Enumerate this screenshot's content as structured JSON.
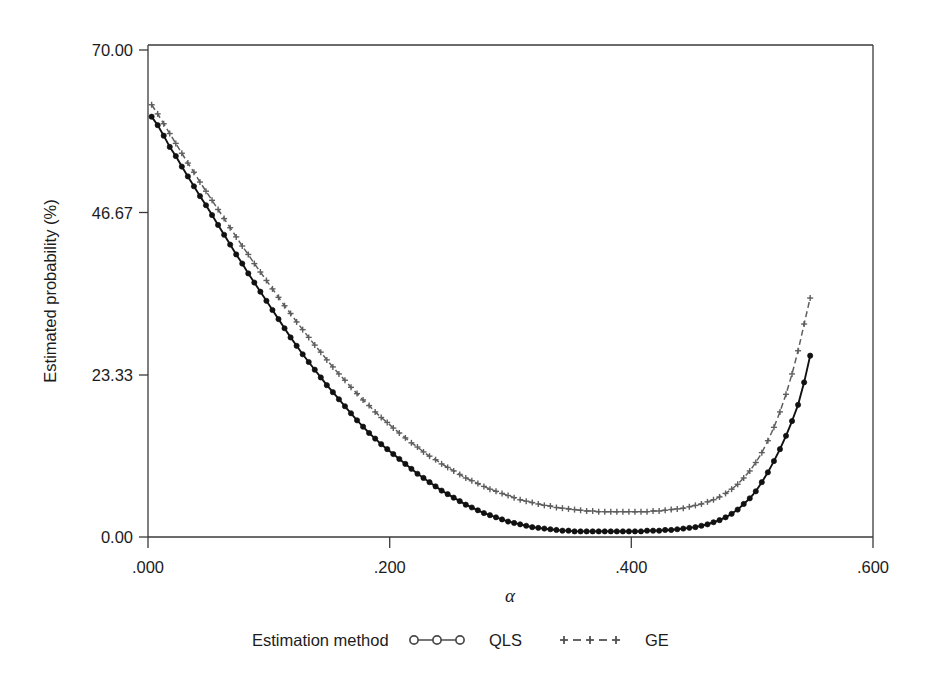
{
  "figure": {
    "background_color": "#ffffff",
    "frame_color": "#3a3a3a"
  },
  "chart_data": {
    "type": "line",
    "title": "",
    "subtitle": "",
    "xlabel": "α",
    "ylabel": "Estimated probability (%)",
    "xlim": [
      0.0,
      0.6
    ],
    "ylim": [
      0.0,
      70.0
    ],
    "grid": false,
    "legend_position": "bottom",
    "legend_title": "Estimation method",
    "x_ticks": [
      0.0,
      0.2,
      0.4,
      0.6
    ],
    "x_tick_labels": [
      ".000",
      ".200",
      ".400",
      ".600"
    ],
    "y_ticks": [
      0.0,
      23.33,
      46.67,
      70.0
    ],
    "y_tick_labels": [
      "0.00",
      "23.33",
      "46.67",
      "70.00"
    ],
    "x": [
      0.003,
      0.008,
      0.013,
      0.018,
      0.023,
      0.028,
      0.033,
      0.038,
      0.043,
      0.048,
      0.053,
      0.058,
      0.063,
      0.068,
      0.073,
      0.078,
      0.083,
      0.088,
      0.093,
      0.098,
      0.103,
      0.108,
      0.113,
      0.118,
      0.123,
      0.128,
      0.133,
      0.138,
      0.143,
      0.148,
      0.153,
      0.158,
      0.163,
      0.168,
      0.173,
      0.178,
      0.183,
      0.188,
      0.193,
      0.198,
      0.203,
      0.208,
      0.213,
      0.218,
      0.223,
      0.228,
      0.233,
      0.238,
      0.243,
      0.248,
      0.253,
      0.258,
      0.263,
      0.268,
      0.273,
      0.278,
      0.283,
      0.288,
      0.293,
      0.298,
      0.303,
      0.308,
      0.313,
      0.318,
      0.323,
      0.328,
      0.333,
      0.338,
      0.343,
      0.348,
      0.353,
      0.358,
      0.363,
      0.368,
      0.373,
      0.378,
      0.383,
      0.388,
      0.393,
      0.398,
      0.403,
      0.408,
      0.413,
      0.418,
      0.423,
      0.428,
      0.433,
      0.438,
      0.443,
      0.448,
      0.453,
      0.458,
      0.463,
      0.468,
      0.473,
      0.478,
      0.483,
      0.488,
      0.493,
      0.498,
      0.503,
      0.508,
      0.513,
      0.518,
      0.523,
      0.528,
      0.533,
      0.538,
      0.543,
      0.548
    ],
    "series": [
      {
        "name": "QLS",
        "marker": "circle-filled",
        "linestyle": "solid",
        "color": "#111111",
        "values": [
          59.8,
          58.6,
          57.1,
          55.5,
          54.2,
          52.7,
          51.3,
          49.9,
          48.5,
          47.2,
          45.8,
          44.4,
          43.0,
          41.6,
          40.2,
          38.9,
          37.5,
          36.2,
          34.9,
          33.6,
          32.3,
          31.0,
          29.7,
          28.4,
          27.2,
          26.0,
          24.9,
          23.8,
          22.7,
          21.6,
          20.6,
          19.6,
          18.6,
          17.6,
          16.6,
          15.7,
          14.8,
          14.0,
          13.2,
          12.5,
          11.8,
          11.1,
          10.4,
          9.7,
          9.0,
          8.4,
          7.8,
          7.2,
          6.6,
          6.1,
          5.6,
          5.1,
          4.6,
          4.2,
          3.8,
          3.4,
          3.1,
          2.8,
          2.5,
          2.2,
          2.0,
          1.8,
          1.6,
          1.4,
          1.3,
          1.2,
          1.1,
          1.0,
          0.9,
          0.9,
          0.8,
          0.8,
          0.8,
          0.8,
          0.8,
          0.8,
          0.8,
          0.8,
          0.8,
          0.8,
          0.8,
          0.8,
          0.9,
          0.9,
          0.9,
          1.0,
          1.0,
          1.1,
          1.2,
          1.3,
          1.4,
          1.6,
          1.8,
          2.1,
          2.4,
          2.8,
          3.3,
          3.9,
          4.7,
          5.5,
          6.5,
          7.8,
          9.2,
          10.8,
          12.5,
          14.4,
          16.5,
          18.8,
          22.0,
          25.8
        ]
      },
      {
        "name": "GE",
        "marker": "plus",
        "linestyle": "dashed",
        "color": "#5e5e5e",
        "values": [
          61.5,
          60.2,
          58.8,
          57.4,
          56.0,
          54.6,
          53.2,
          51.9,
          50.5,
          49.2,
          47.9,
          46.6,
          45.3,
          44.0,
          42.7,
          41.4,
          40.2,
          38.9,
          37.7,
          36.5,
          35.3,
          34.1,
          32.9,
          31.8,
          30.6,
          29.5,
          28.4,
          27.3,
          26.3,
          25.2,
          24.2,
          23.2,
          22.3,
          21.3,
          20.4,
          19.5,
          18.7,
          17.8,
          17.0,
          16.3,
          15.5,
          14.8,
          14.1,
          13.4,
          12.8,
          12.1,
          11.5,
          11.0,
          10.4,
          9.9,
          9.4,
          8.9,
          8.4,
          8.0,
          7.6,
          7.2,
          6.8,
          6.5,
          6.2,
          5.9,
          5.6,
          5.3,
          5.1,
          4.9,
          4.7,
          4.5,
          4.4,
          4.2,
          4.1,
          4.0,
          3.9,
          3.8,
          3.7,
          3.7,
          3.6,
          3.6,
          3.6,
          3.6,
          3.6,
          3.6,
          3.6,
          3.6,
          3.6,
          3.7,
          3.7,
          3.8,
          3.9,
          4.0,
          4.1,
          4.3,
          4.5,
          4.7,
          5.0,
          5.3,
          5.7,
          6.2,
          6.8,
          7.5,
          8.4,
          9.4,
          10.6,
          12.0,
          13.7,
          15.6,
          17.8,
          20.3,
          23.2,
          26.5,
          30.3,
          34.0
        ]
      }
    ]
  },
  "legend": {
    "title": "Estimation method",
    "entries": [
      {
        "label": "QLS",
        "marker": "circle-line-marker"
      },
      {
        "label": "GE",
        "marker": "plus-dash-marker"
      }
    ]
  },
  "axes": {
    "y_axis_title": "Estimated probability (%)",
    "x_axis_title": "α"
  }
}
